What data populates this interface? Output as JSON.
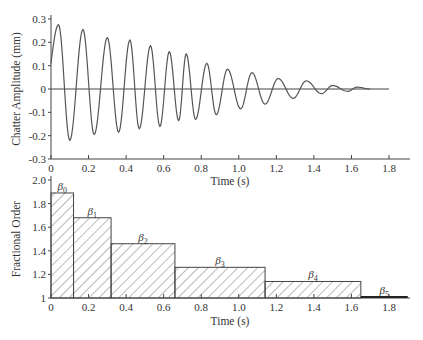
{
  "chart_data": [
    {
      "type": "line",
      "title": "",
      "xlabel": "Time (s)",
      "ylabel": "Chatter Amplitude (mm)",
      "xlim": [
        0,
        1.8
      ],
      "ylim": [
        -0.3,
        0.3
      ],
      "xticks": [
        "0",
        "0.2",
        "0.4",
        "0.6",
        "0.8",
        "1.0",
        "1.2",
        "1.4",
        "1.6",
        "1.8"
      ],
      "yticks": [
        "-0.3",
        "-0.2",
        "-0.1",
        "0",
        "0.1",
        "0.2",
        "0.3"
      ],
      "grid": false,
      "series": [
        {
          "name": "chatter amplitude",
          "description": "decaying oscillation, peaks listed",
          "peaks": [
            {
              "t": 0.04,
              "v": 0.275
            },
            {
              "t": 0.1,
              "v": -0.22
            },
            {
              "t": 0.17,
              "v": 0.255
            },
            {
              "t": 0.23,
              "v": -0.195
            },
            {
              "t": 0.3,
              "v": 0.22
            },
            {
              "t": 0.36,
              "v": -0.185
            },
            {
              "t": 0.42,
              "v": 0.21
            },
            {
              "t": 0.47,
              "v": -0.17
            },
            {
              "t": 0.53,
              "v": 0.185
            },
            {
              "t": 0.58,
              "v": -0.16
            },
            {
              "t": 0.63,
              "v": 0.16
            },
            {
              "t": 0.68,
              "v": -0.135
            },
            {
              "t": 0.72,
              "v": 0.15
            },
            {
              "t": 0.77,
              "v": -0.13
            },
            {
              "t": 0.83,
              "v": 0.11
            },
            {
              "t": 0.88,
              "v": -0.11
            },
            {
              "t": 0.94,
              "v": 0.085
            },
            {
              "t": 1.01,
              "v": -0.085
            },
            {
              "t": 1.07,
              "v": 0.07
            },
            {
              "t": 1.14,
              "v": -0.065
            },
            {
              "t": 1.21,
              "v": 0.045
            },
            {
              "t": 1.29,
              "v": -0.04
            },
            {
              "t": 1.36,
              "v": 0.035
            },
            {
              "t": 1.44,
              "v": -0.02
            },
            {
              "t": 1.5,
              "v": 0.015
            },
            {
              "t": 1.58,
              "v": -0.01
            },
            {
              "t": 1.63,
              "v": 0.008
            },
            {
              "t": 1.7,
              "v": 0.0
            }
          ]
        }
      ]
    },
    {
      "type": "bar",
      "title": "",
      "xlabel": "Time (s)",
      "ylabel": "Fractional Order",
      "xlim": [
        0,
        1.9
      ],
      "ylim": [
        1,
        2.0
      ],
      "xticks": [
        "0",
        "0.2",
        "0.4",
        "0.6",
        "0.8",
        "1.0",
        "1.2",
        "1.4",
        "1.6",
        "1.8"
      ],
      "yticks": [
        "1",
        "1.2",
        "1.4",
        "1.6",
        "1.8",
        "2.0"
      ],
      "grid": false,
      "bars": [
        {
          "label": "β0",
          "name": "β",
          "sub": "0",
          "x0": 0.0,
          "x1": 0.12,
          "value": 1.89
        },
        {
          "label": "β1",
          "name": "β",
          "sub": "1",
          "x0": 0.12,
          "x1": 0.32,
          "value": 1.68
        },
        {
          "label": "β2",
          "name": "β",
          "sub": "2",
          "x0": 0.32,
          "x1": 0.66,
          "value": 1.46
        },
        {
          "label": "β3",
          "name": "β",
          "sub": "3",
          "x0": 0.66,
          "x1": 1.14,
          "value": 1.26
        },
        {
          "label": "β4",
          "name": "β",
          "sub": "4",
          "x0": 1.14,
          "x1": 1.65,
          "value": 1.14
        },
        {
          "label": "β5",
          "name": "β",
          "sub": "5",
          "x0": 1.65,
          "x1": 1.9,
          "value": 1.01
        }
      ]
    }
  ],
  "top": {
    "xlabel": "Time (s)",
    "ylabel": "Chatter Amplitude (mm)"
  },
  "bottom": {
    "xlabel": "Time (s)",
    "ylabel": "Fractional Order"
  },
  "colors": {
    "line": "#555555",
    "axis": "#444444",
    "hatch": "#666666"
  }
}
